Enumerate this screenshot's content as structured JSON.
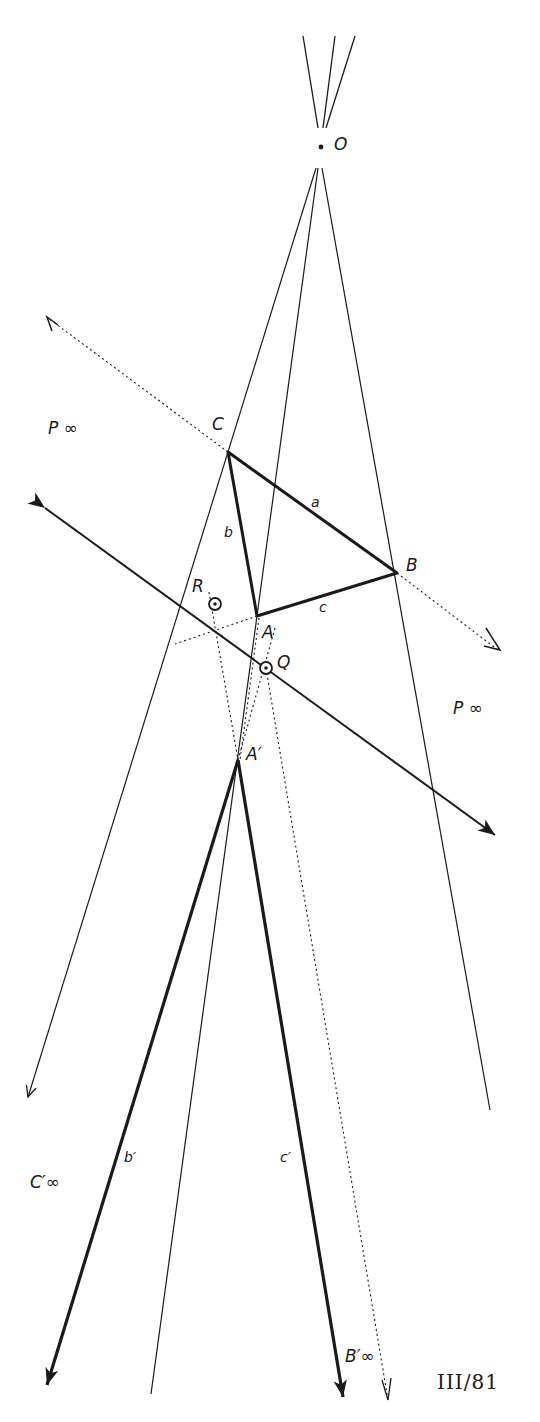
{
  "figure_id": "III/81",
  "labels": {
    "O": "O",
    "C": "C",
    "B": "B",
    "A": "A",
    "R": "R",
    "Q": "Q",
    "A_prime": "A′",
    "a": "a",
    "b": "b",
    "c": "c",
    "b_prime": "b′",
    "c_prime": "c′",
    "P_inf_left": "P ∞",
    "P_inf_right": "P ∞",
    "C_prime_inf": "C′∞",
    "B_prime_inf": "B′∞"
  },
  "colors": {
    "ink": "#1a1a1a",
    "background": "#ffffff"
  }
}
